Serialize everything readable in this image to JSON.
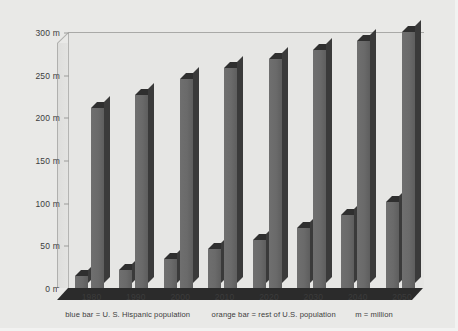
{
  "chart_data": {
    "type": "bar",
    "title": "",
    "subtitle": "",
    "xlabel": "",
    "ylabel": "",
    "categories": [
      "1980",
      "1990",
      "2000",
      "2010",
      "2020",
      "2030",
      "2040",
      "2050"
    ],
    "ylim": [
      0,
      300
    ],
    "yticks": [
      0,
      50,
      100,
      150,
      200,
      250,
      300
    ],
    "ytick_labels": [
      "0 m",
      "50 m",
      "100 m",
      "150 m",
      "200 m",
      "250 m",
      "300 m"
    ],
    "grid": false,
    "legend_position": "below-axis",
    "series": [
      {
        "name": "U. S. Hispanic population",
        "key": "hispanic",
        "color": "#6a6a6a",
        "values": [
          15,
          22,
          35,
          47,
          57,
          72,
          87,
          102
        ]
      },
      {
        "name": "rest of U.S. population",
        "key": "rest",
        "color": "#6a6a6a",
        "values": [
          212,
          227,
          246,
          259,
          269,
          280,
          291,
          301
        ]
      }
    ],
    "annotations": [
      "blue bar = U. S. Hispanic population",
      "orange bar = rest of U.S. population",
      "m = million"
    ]
  },
  "legend": {
    "hispanic_note": "blue bar = U. S. Hispanic population",
    "rest_note": "orange bar = rest of U.S. population",
    "unit_note": "m = million"
  },
  "axis": {
    "y": {
      "t0": "0 m",
      "t1": "50 m",
      "t2": "100 m",
      "t3": "150 m",
      "t4": "200 m",
      "t5": "250 m",
      "t6": "300 m"
    },
    "x": {
      "c0": "1980",
      "c1": "1990",
      "c2": "2000",
      "c3": "2010",
      "c4": "2020",
      "c5": "2030",
      "c6": "2040",
      "c7": "2050"
    }
  },
  "colors": {
    "background": "#e9e9e7",
    "plot_background": "#e6e6e4",
    "bar_face": "#6a6a6a",
    "bar_top": "#2f2f2f",
    "bar_side": "#3a3a3a",
    "floor": "#2b2b2b",
    "text": "#3c3c3c"
  }
}
